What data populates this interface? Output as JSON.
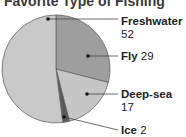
{
  "chart_data": {
    "type": "pie",
    "title": "Favorite Type of Fishing",
    "slices": [
      {
        "label": "Fly",
        "value": 29,
        "color": "#9e9e9e"
      },
      {
        "label": "Deep-sea",
        "value": 17,
        "color": "#c6c6c6"
      },
      {
        "label": "Ice",
        "value": 2,
        "color": "#5a5a5a"
      },
      {
        "label": "Freshwater",
        "value": 52,
        "color": "#c9c9c9"
      }
    ],
    "labels_position": "right, with leader lines"
  },
  "labels": {
    "freshwater_name": "Freshwater",
    "freshwater_value": "52",
    "fly_name": "Fly",
    "fly_value": "29",
    "deepsea_name": "Deep-sea",
    "deepsea_value": "17",
    "ice_name": "Ice",
    "ice_value": "2"
  }
}
